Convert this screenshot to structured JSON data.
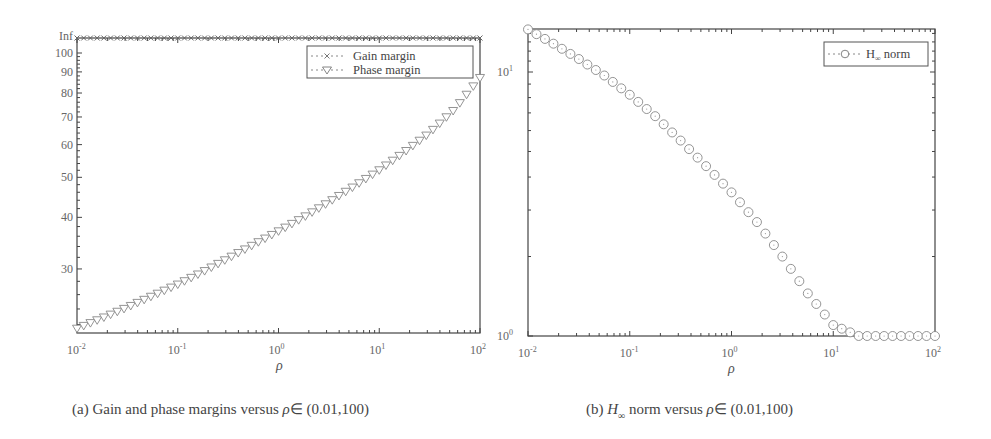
{
  "chart_data": [
    {
      "type": "line",
      "id": "a",
      "title": "",
      "caption": "(a) Gain and phase margins versus ρ∈ (0.01,100)",
      "xlabel": "ρ",
      "ylabel": "",
      "xscale": "log",
      "yscale": "log",
      "xlim": [
        0.01,
        100
      ],
      "ylim": [
        21,
        "Inf"
      ],
      "x_ticks": [
        "10^-2",
        "10^-1",
        "10^0",
        "10^1",
        "10^2"
      ],
      "y_ticks": [
        "30",
        "40",
        "50",
        "60",
        "70",
        "80",
        "90",
        "100",
        "Inf"
      ],
      "legend": {
        "position": "upper right",
        "entries": [
          "Gain margin",
          "Phase margin"
        ]
      },
      "grid": false,
      "series": [
        {
          "name": "Gain margin",
          "marker": "x",
          "values_note": "Inf for all ρ",
          "x": [
            0.01,
            0.1,
            1,
            10,
            100
          ],
          "values": [
            "Inf",
            "Inf",
            "Inf",
            "Inf",
            "Inf"
          ]
        },
        {
          "name": "Phase margin",
          "marker": "triangle-down",
          "x": [
            0.01,
            0.0178,
            0.0316,
            0.0562,
            0.1,
            0.178,
            0.316,
            0.562,
            1,
            1.78,
            3.16,
            5.62,
            10,
            17.8,
            31.6,
            56.2,
            100
          ],
          "values": [
            21.5,
            22.8,
            24.2,
            25.8,
            27.5,
            29.5,
            31.8,
            34.3,
            37,
            40,
            43.5,
            47.5,
            52,
            57.5,
            64,
            73,
            87
          ]
        }
      ]
    },
    {
      "type": "line",
      "id": "b",
      "title": "",
      "caption": "(b) H∞ norm versus ρ∈ (0.01,100)",
      "xlabel": "ρ",
      "ylabel": "",
      "xscale": "log",
      "yscale": "log",
      "xlim": [
        0.01,
        100
      ],
      "ylim": [
        1,
        14.5
      ],
      "x_ticks": [
        "10^-2",
        "10^-1",
        "10^0",
        "10^1",
        "10^2"
      ],
      "y_ticks": [
        "10^0",
        "10^1"
      ],
      "legend": {
        "position": "upper right",
        "entries": [
          "H∞ norm"
        ]
      },
      "grid": false,
      "series": [
        {
          "name": "H∞ norm",
          "marker": "circle",
          "x": [
            0.01,
            0.0178,
            0.0316,
            0.0562,
            0.1,
            0.178,
            0.316,
            0.562,
            1,
            1.78,
            3.16,
            5.62,
            10,
            17.8,
            31.6,
            56.2,
            100
          ],
          "values": [
            14.5,
            12.8,
            11.2,
            9.7,
            8.2,
            6.8,
            5.5,
            4.4,
            3.5,
            2.7,
            2.0,
            1.45,
            1.1,
            1.0,
            1.0,
            1.0,
            1.0
          ]
        }
      ]
    }
  ],
  "left": {
    "y_labels": [
      "Inf",
      "100",
      "90",
      "80",
      "70",
      "60",
      "50",
      "40",
      "30"
    ],
    "x_labels": [
      "10",
      "10",
      "10",
      "10",
      "10"
    ],
    "x_exps": [
      "-2",
      "-1",
      "0",
      "1",
      "2"
    ],
    "xlabel": "ρ",
    "legend": [
      "Gain margin",
      "Phase margin"
    ],
    "caption_prefix": "(a) Gain and phase margins versus ",
    "caption_rho": "ρ",
    "caption_suffix": "∈ (0.01,100)"
  },
  "right": {
    "y_labels": [
      "10",
      "10"
    ],
    "y_exps": [
      "1",
      "0"
    ],
    "x_labels": [
      "10",
      "10",
      "10",
      "10",
      "10"
    ],
    "x_exps": [
      "-2",
      "-1",
      "0",
      "1",
      "2"
    ],
    "xlabel": "ρ",
    "legend_main": "H",
    "legend_sub": "∞",
    "legend_tail": " norm",
    "caption_prefix": "(b) ",
    "caption_h": "H",
    "caption_sub": "∞",
    "caption_mid": " norm versus ",
    "caption_rho": "ρ",
    "caption_suffix": "∈ (0.01,100)"
  },
  "colors": {
    "axis": "#444444",
    "marker": "#777777",
    "text": "#555555"
  }
}
